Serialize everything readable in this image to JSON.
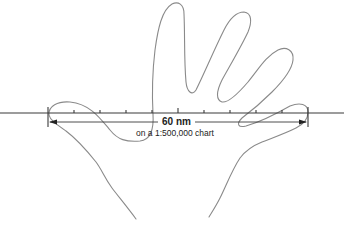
{
  "diagram": {
    "measurement": {
      "distance_label": "60 nm",
      "scale_label": "on a 1:500,000 chart"
    },
    "scale": {
      "tick_count": 11,
      "major_tick_positions_x": [
        48,
        178,
        308
      ],
      "minor_tick_positions_x": [
        74,
        100,
        126,
        152,
        204,
        230,
        256,
        282
      ]
    },
    "colors": {
      "hand_outline": "#8a8a8a",
      "scale_line": "#3a3a3a",
      "text": "#222222",
      "background": "#ffffff"
    }
  }
}
